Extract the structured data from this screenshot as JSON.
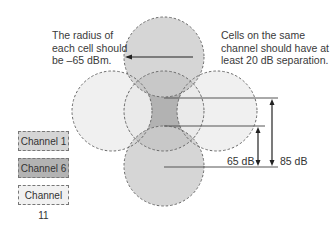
{
  "annotations": {
    "radius_note": "The radius of each cell should be –65 dBm.",
    "separation_note": "Cells on the same channel should have at least 20 dB separation."
  },
  "legend": [
    {
      "label": "Channel 1",
      "color": "#d5d5d5"
    },
    {
      "label": "Channel 6",
      "color": "#b3b3b3"
    },
    {
      "label": "Channel 11",
      "color": "#f1f1f1"
    }
  ],
  "measurements": {
    "inner": "65 dB",
    "outer": "85 dB"
  },
  "cells": [
    {
      "position": "top",
      "channel": "Channel 1"
    },
    {
      "position": "left",
      "channel": "Channel 11"
    },
    {
      "position": "center",
      "channel": "Channel 6"
    },
    {
      "position": "right",
      "channel": "Channel 11"
    },
    {
      "position": "bottom",
      "channel": "Channel 1"
    }
  ]
}
